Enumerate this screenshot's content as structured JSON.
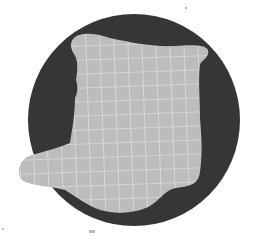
{
  "colors": {
    "background": "#ffffff",
    "circle": "#363636",
    "blob": "#bcbcbc",
    "grid": "#e8e8e8"
  },
  "diagram": {
    "shapes": [
      {
        "type": "circle",
        "label": "dark-disc"
      },
      {
        "type": "blob",
        "label": "gridded-region",
        "pattern": "grid"
      }
    ]
  }
}
